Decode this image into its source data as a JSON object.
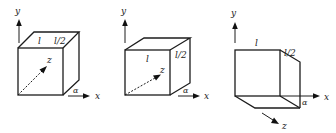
{
  "figure": {
    "background": "#ffffff",
    "stroke_color": "#1c1c1c",
    "panels": [
      {
        "id": "panel-1",
        "labels": {
          "y_axis": "y",
          "x_axis": "x",
          "z_axis": "z",
          "angle": "α",
          "length": "l",
          "half_length": "l/2"
        },
        "description": "Cube viewed from front-right; z axis points into the page (dashed)."
      },
      {
        "id": "panel-2",
        "labels": {
          "y_axis": "y",
          "x_axis": "x",
          "z_axis": "z",
          "angle": "α",
          "length": "l",
          "half_length": "l/2"
        },
        "description": "Box viewed from front-right; z axis dashed into page; l label on front face."
      },
      {
        "id": "panel-3",
        "labels": {
          "y_axis": "y",
          "x_axis": "x",
          "z_axis": "z",
          "angle": "α",
          "length": "l",
          "half_length": "l/2"
        },
        "description": "Box viewed from below-right; z axis points out of page toward lower right."
      }
    ]
  }
}
